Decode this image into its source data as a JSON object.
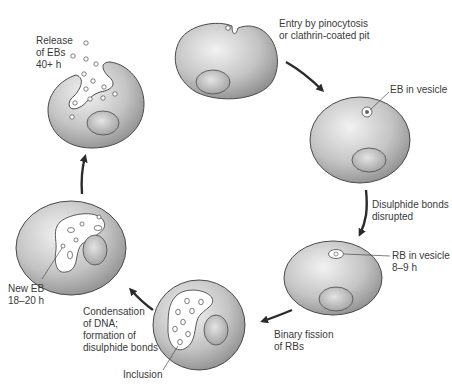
{
  "colors": {
    "cell_light": "#eeeeee",
    "cell_dark": "#9a9a9a",
    "outline": "#4a4a4a",
    "arrow": "#2b2b2b",
    "text": "#3a3a3a"
  },
  "labels": {
    "entry": "Entry by pinocytosis\nor clathrin-coated pit",
    "eb_vesicle": "EB in vesicle",
    "disulphide_disrupted": "Disulphide bonds\ndisrupted",
    "rb_vesicle": "RB in vesicle\n8–9 h",
    "binary_fission": "Binary fission\nof RBs",
    "condensation": "Condensation\nof DNA;\nformation of\ndisulphide bonds",
    "inclusion": "Inclusion",
    "new_eb": "New EB\n18–20 h",
    "release": "Release\nof EBs\n40+ h"
  },
  "stages": [
    {
      "id": "entry",
      "label": "Entry by pinocytosis or clathrin-coated pit"
    },
    {
      "id": "eb-in-vesicle",
      "label": "EB in vesicle"
    },
    {
      "id": "rb-in-vesicle",
      "label": "RB in vesicle 8–9 h"
    },
    {
      "id": "inclusion",
      "label": "Inclusion"
    },
    {
      "id": "new-eb",
      "label": "New EB 18–20 h"
    },
    {
      "id": "release",
      "label": "Release of EBs 40+ h"
    }
  ]
}
